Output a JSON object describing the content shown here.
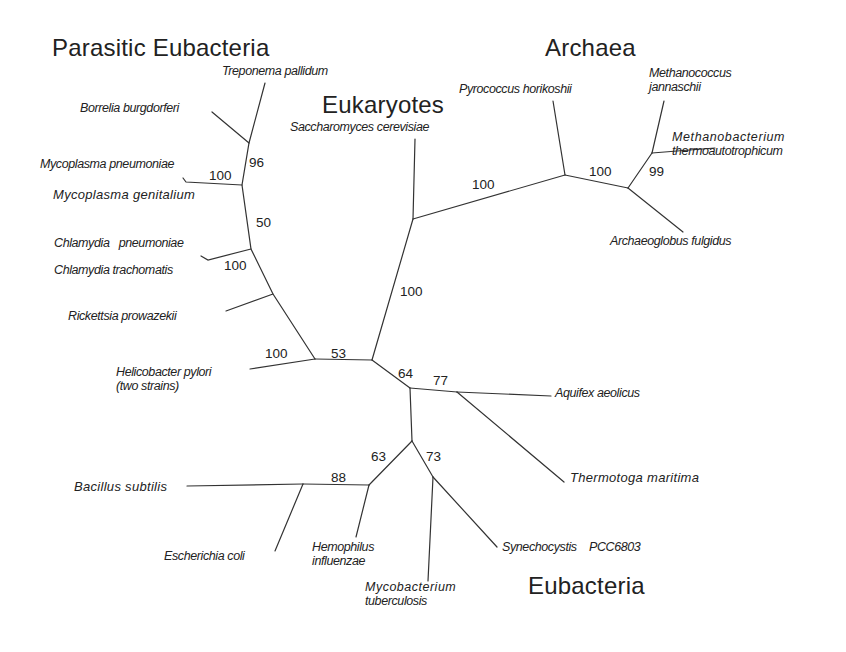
{
  "diagram": {
    "type": "unrooted phylogenetic tree",
    "line_color": "#333333",
    "groups": [
      {
        "id": "parasitic",
        "label": "Parasitic Eubacteria"
      },
      {
        "id": "archaea",
        "label": "Archaea"
      },
      {
        "id": "eukaryotes",
        "label": "Eukaryotes"
      },
      {
        "id": "eubacteria",
        "label": "Eubacteria"
      }
    ],
    "taxa": [
      {
        "id": "treponema",
        "label": "Treponema pallidum",
        "group": "parasitic"
      },
      {
        "id": "borrelia",
        "label": "Borrelia burgdorferi",
        "group": "parasitic"
      },
      {
        "id": "m_pneumoniae",
        "label": "Mycoplasma pneumoniae",
        "group": "parasitic"
      },
      {
        "id": "m_genitalium",
        "label": "Mycoplasma genitalium",
        "group": "parasitic"
      },
      {
        "id": "c_pneumoniae",
        "label": "Chlamydia   pneumoniae",
        "group": "parasitic"
      },
      {
        "id": "c_trachomatis",
        "label": "Chlamydia trachomatis",
        "group": "parasitic"
      },
      {
        "id": "rickettsia",
        "label": "Rickettsia prowazekii",
        "group": "parasitic"
      },
      {
        "id": "helicobacter",
        "label": "Helicobacter pylori",
        "label2": "(two strains)",
        "group": "parasitic"
      },
      {
        "id": "saccharomyces",
        "label": "Saccharomyces cerevisiae",
        "group": "eukaryotes"
      },
      {
        "id": "pyrococcus",
        "label": "Pyrococcus horikoshii",
        "group": "archaea"
      },
      {
        "id": "methanococcus",
        "label": "Methanococcus",
        "label2": "jannaschii",
        "group": "archaea"
      },
      {
        "id": "methanobacterium",
        "label": "Methanobacterium",
        "label2": "thermoautotrophicum",
        "group": "archaea"
      },
      {
        "id": "archaeoglobus",
        "label": "Archaeoglobus fulgidus",
        "group": "archaea"
      },
      {
        "id": "aquifex",
        "label": "Aquifex aeolicus",
        "group": "eubacteria"
      },
      {
        "id": "thermotoga",
        "label": "Thermotoga maritima",
        "group": "eubacteria"
      },
      {
        "id": "bacillus",
        "label": "Bacillus subtilis",
        "group": "eubacteria"
      },
      {
        "id": "ecoli",
        "label": "Escherichia coli",
        "group": "eubacteria"
      },
      {
        "id": "hemophilus",
        "label": "Hemophilus",
        "label2": "influenzae",
        "group": "eubacteria"
      },
      {
        "id": "mycobacterium",
        "label": "Mycobacterium",
        "label2": "tuberculosis",
        "group": "eubacteria"
      },
      {
        "id": "synechocystis",
        "label": "Synechocystis    PCC6803",
        "group": "eubacteria"
      }
    ],
    "bootstrap": [
      {
        "id": "b96",
        "value": "96"
      },
      {
        "id": "b100_myco",
        "value": "100"
      },
      {
        "id": "b50",
        "value": "50"
      },
      {
        "id": "b100_chlam",
        "value": "100"
      },
      {
        "id": "b100_helico",
        "value": "100"
      },
      {
        "id": "b53",
        "value": "53"
      },
      {
        "id": "b100_euk",
        "value": "100"
      },
      {
        "id": "b100_arch_stem",
        "value": "100"
      },
      {
        "id": "b100_arch",
        "value": "100"
      },
      {
        "id": "b99",
        "value": "99"
      },
      {
        "id": "b64",
        "value": "64"
      },
      {
        "id": "b77",
        "value": "77"
      },
      {
        "id": "b63",
        "value": "63"
      },
      {
        "id": "b73",
        "value": "73"
      },
      {
        "id": "b88",
        "value": "88"
      }
    ]
  }
}
